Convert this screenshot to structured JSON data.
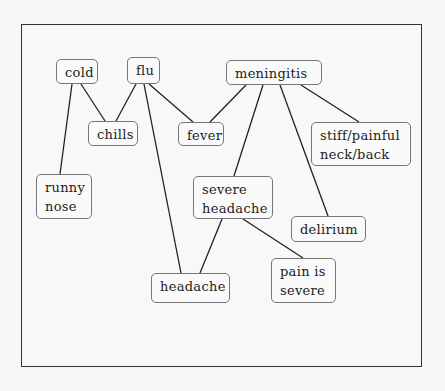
{
  "diagram": {
    "type": "symptom-disease graph",
    "nodes": [
      {
        "id": "cold",
        "label": "cold",
        "x": 56,
        "y": 59,
        "w": 42,
        "h": 25
      },
      {
        "id": "flu",
        "label": "flu",
        "x": 127,
        "y": 57,
        "w": 33,
        "h": 27
      },
      {
        "id": "meningitis",
        "label": "meningitis",
        "x": 226,
        "y": 60,
        "w": 96,
        "h": 25
      },
      {
        "id": "chills",
        "label": "chills",
        "x": 88,
        "y": 121,
        "w": 50,
        "h": 25
      },
      {
        "id": "fever",
        "label": "fever",
        "x": 178,
        "y": 122,
        "w": 46,
        "h": 24
      },
      {
        "id": "stiff",
        "label": "stiff/painful\nneck/back",
        "x": 311,
        "y": 122,
        "w": 100,
        "h": 44
      },
      {
        "id": "runny_nose",
        "label": "runny\nnose",
        "x": 36,
        "y": 174,
        "w": 56,
        "h": 45
      },
      {
        "id": "severe_headache",
        "label": "severe\nheadache",
        "x": 193,
        "y": 176,
        "w": 80,
        "h": 43
      },
      {
        "id": "delirium",
        "label": "delirium",
        "x": 291,
        "y": 216,
        "w": 75,
        "h": 26
      },
      {
        "id": "headache",
        "label": "headache",
        "x": 151,
        "y": 273,
        "w": 79,
        "h": 30
      },
      {
        "id": "pain_severe",
        "label": "pain is\nsevere",
        "x": 271,
        "y": 258,
        "w": 65,
        "h": 45
      }
    ],
    "edges": [
      {
        "from": "cold",
        "to": "chills",
        "x1": 81,
        "y1": 84,
        "x2": 105,
        "y2": 121
      },
      {
        "from": "cold",
        "to": "runny_nose",
        "x1": 72,
        "y1": 84,
        "x2": 60,
        "y2": 174
      },
      {
        "from": "flu",
        "to": "chills",
        "x1": 136,
        "y1": 84,
        "x2": 116,
        "y2": 121
      },
      {
        "from": "flu",
        "to": "fever",
        "x1": 149,
        "y1": 84,
        "x2": 193,
        "y2": 122
      },
      {
        "from": "flu",
        "to": "headache",
        "x1": 144,
        "y1": 84,
        "x2": 181,
        "y2": 273
      },
      {
        "from": "meningitis",
        "to": "fever",
        "x1": 246,
        "y1": 85,
        "x2": 210,
        "y2": 122
      },
      {
        "from": "meningitis",
        "to": "severe_headache",
        "x1": 263,
        "y1": 85,
        "x2": 234,
        "y2": 176
      },
      {
        "from": "meningitis",
        "to": "delirium",
        "x1": 280,
        "y1": 85,
        "x2": 328,
        "y2": 216
      },
      {
        "from": "meningitis",
        "to": "stiff",
        "x1": 301,
        "y1": 85,
        "x2": 359,
        "y2": 122
      },
      {
        "from": "severe_headache",
        "to": "headache",
        "x1": 222,
        "y1": 219,
        "x2": 200,
        "y2": 273
      },
      {
        "from": "severe_headache",
        "to": "pain_severe",
        "x1": 243,
        "y1": 219,
        "x2": 303,
        "y2": 258
      }
    ]
  },
  "colors": {
    "background": "#f7f7f7",
    "frame_border": "#333333",
    "node_border": "#777777",
    "edge": "#222222",
    "text": "#222222"
  }
}
